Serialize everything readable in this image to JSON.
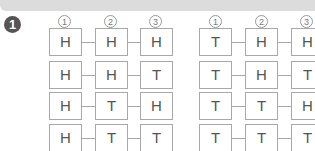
{
  "badge": "1",
  "headers": [
    "1",
    "2",
    "3"
  ],
  "grids": [
    {
      "rows": [
        [
          "H",
          "H",
          "H"
        ],
        [
          "H",
          "H",
          "T"
        ],
        [
          "H",
          "T",
          "H"
        ],
        [
          "H",
          "T",
          "T"
        ]
      ]
    },
    {
      "rows": [
        [
          "T",
          "H",
          "H"
        ],
        [
          "T",
          "H",
          "T"
        ],
        [
          "T",
          "T",
          "H"
        ],
        [
          "T",
          "T",
          "T"
        ]
      ]
    }
  ],
  "colors": {
    "banner": "#dcdcdc",
    "badge": "#555555",
    "border": "#a8a8a8",
    "text": "#555555"
  }
}
